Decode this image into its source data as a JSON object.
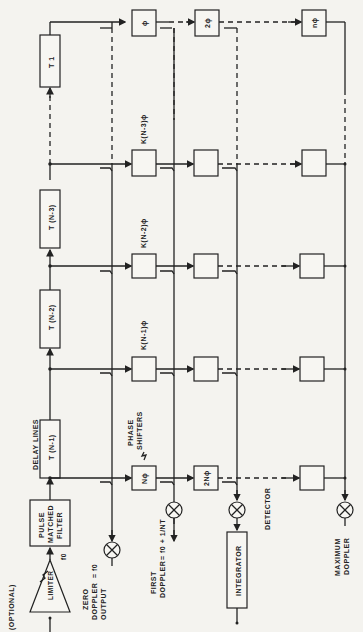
{
  "diagram": {
    "optional_label": "(OPTIONAL)",
    "limiter": {
      "label": "LIMITER",
      "freq": "f0"
    },
    "matched_filter": {
      "line1": "PULSE",
      "line2": "MATCHED",
      "line3": "FILTER"
    },
    "delay_lines_label": "DELAY LINES",
    "delay_lines": [
      "T (N-1)",
      "T (N-2)",
      "T (N-3)",
      "T 1"
    ],
    "phase_shifters_label": {
      "line1": "PHASE",
      "line2": "SHIFTERS"
    },
    "phase_boxes_row0": [
      "Nϕ",
      "2Nϕ",
      ""
    ],
    "phase_labels_rows": [
      "K(N-1)ϕ",
      "K(N-2)ϕ",
      "K(N-3)ϕ"
    ],
    "phase_boxes_last_row": [
      "ϕ",
      "2ϕ",
      "nϕ"
    ],
    "outputs": {
      "zero": {
        "line1": "ZERO",
        "line2": "DOPPLER",
        "line3": "OUTPUT",
        "formula": "= f0"
      },
      "first": {
        "line1": "FIRST",
        "line2": "DOPPLER",
        "formula": "= f0 + 1/NT"
      },
      "maximum": {
        "line1": "MAXIMUM",
        "line2": "DOPPLER"
      }
    },
    "detector_label": "DETECTOR",
    "integrator_label": "INTEGRATOR"
  }
}
